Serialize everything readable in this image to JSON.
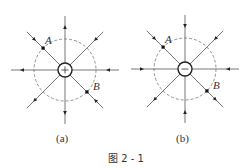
{
  "figure": {
    "caption": "图 2 - 1",
    "panels": [
      {
        "id": "a",
        "label": "(a)",
        "charge_sign": "+",
        "points": [
          {
            "name": "A",
            "direction": "upper-left"
          },
          {
            "name": "B",
            "direction": "lower-right"
          }
        ],
        "field_lines": [
          {
            "direction": "up",
            "arrow": "out"
          },
          {
            "direction": "upper-right",
            "arrow": "in"
          },
          {
            "direction": "right",
            "arrow": "in"
          },
          {
            "direction": "lower-right",
            "arrow": "in"
          },
          {
            "direction": "down",
            "arrow": "out"
          },
          {
            "direction": "lower-left",
            "arrow": "out"
          },
          {
            "direction": "left",
            "arrow": "out"
          },
          {
            "direction": "upper-left",
            "arrow": "in"
          }
        ]
      },
      {
        "id": "b",
        "label": "(b)",
        "charge_sign": "−",
        "points": [
          {
            "name": "A",
            "direction": "upper-left"
          },
          {
            "name": "B",
            "direction": "lower-right"
          }
        ],
        "field_lines": [
          {
            "direction": "up",
            "arrow": "in"
          },
          {
            "direction": "upper-right",
            "arrow": "in"
          },
          {
            "direction": "right",
            "arrow": "in"
          },
          {
            "direction": "lower-right",
            "arrow": "out"
          },
          {
            "direction": "down",
            "arrow": "in"
          },
          {
            "direction": "lower-left",
            "arrow": "out"
          },
          {
            "direction": "left",
            "arrow": "in"
          },
          {
            "direction": "upper-left",
            "arrow": "in"
          }
        ]
      }
    ]
  }
}
